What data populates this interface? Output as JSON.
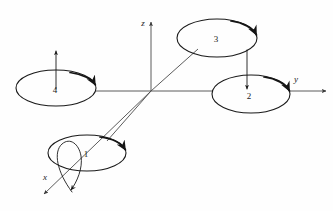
{
  "figure": {
    "title": "Quadrotor rotor numbering and body coordinate frame",
    "background_color": "#fefefe",
    "line_color": "#1a1a1a",
    "axis_color": "#4a4a4a",
    "width": 333,
    "height": 211
  },
  "axes": [
    {
      "id": "z",
      "label": "z",
      "label_x": 143,
      "label_y": 26,
      "description": "vertical axis pointing up from origin"
    },
    {
      "id": "y",
      "label": "y",
      "label_x": 296,
      "label_y": 82,
      "description": "horizontal axis pointing right through rotor 2"
    },
    {
      "id": "x",
      "label": "x",
      "label_x": 45,
      "label_y": 180,
      "description": "diagonal axis pointing down-left through rotor 1"
    }
  ],
  "origin": {
    "x": 151,
    "y": 91
  },
  "rotors": [
    {
      "id": "rotor-1",
      "label": "1",
      "center_x": 87,
      "center_y": 153,
      "radius_x": 39,
      "radius_y": 18,
      "label_x": 86,
      "label_y": 157,
      "spin_arrow": "clockwise-from-right",
      "thrust_arrow": "none"
    },
    {
      "id": "rotor-2",
      "label": "2",
      "center_x": 251,
      "center_y": 94,
      "radius_x": 39,
      "radius_y": 19,
      "label_x": 249,
      "label_y": 99,
      "spin_arrow": "clockwise-from-right",
      "thrust_arrow": "down"
    },
    {
      "id": "rotor-3",
      "label": "3",
      "center_x": 217,
      "center_y": 38,
      "radius_x": 40,
      "radius_y": 19,
      "label_x": 216,
      "label_y": 42,
      "spin_arrow": "clockwise-from-right",
      "thrust_arrow": "none"
    },
    {
      "id": "rotor-4",
      "label": "4",
      "center_x": 56,
      "center_y": 88,
      "radius_x": 40,
      "radius_y": 18,
      "label_x": 55,
      "label_y": 93,
      "spin_arrow": "clockwise-from-right",
      "thrust_arrow": "up"
    }
  ],
  "connectors": [
    {
      "id": "arm-y-left",
      "from_x": 96,
      "from_y": 91,
      "to_x": 151,
      "to_y": 91
    },
    {
      "id": "arm-y-right",
      "from_x": 151,
      "from_y": 91,
      "to_x": 212,
      "to_y": 91
    },
    {
      "id": "arm-x-upper",
      "from_x": 151,
      "from_y": 91,
      "to_x": 197,
      "to_y": 50
    },
    {
      "id": "arm-x-lower",
      "from_x": 151,
      "from_y": 91,
      "to_x": 108,
      "to_y": 140
    }
  ],
  "thrust_arrows": [
    {
      "id": "thrust-rotor-4",
      "label": "upward thrust on rotor 4",
      "from_x": 56,
      "from_y": 88,
      "to_x": 56,
      "to_y": 51,
      "direction": "up"
    },
    {
      "id": "thrust-rotor-3-to-2",
      "label": "downward arrow from rotor 3 into rotor 2",
      "from_x": 247,
      "from_y": 50,
      "to_x": 247,
      "to_y": 89,
      "direction": "down"
    }
  ],
  "x_axis_detail": {
    "shaft_from_x": 151,
    "shaft_from_y": 91,
    "shaft_to_x": 42,
    "shaft_to_y": 196,
    "loop_description": "teardrop rotation loop around x axis with second arrowhead"
  }
}
